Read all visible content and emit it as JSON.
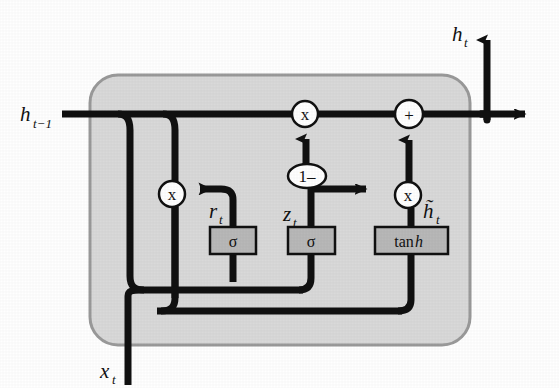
{
  "figure": {
    "background_color": "#ffffff",
    "line_color": "#111111",
    "cell_fill_color": "#d9d9d9",
    "cell_border_color": "#9a9a9a",
    "gate_fill_color": "#b8b8b8",
    "gate_border_color": "#111111"
  },
  "labels": {
    "prev_hidden_state": "h",
    "prev_hidden_state_sub": "t−1",
    "output_hidden_state": "h",
    "output_hidden_state_sub": "t",
    "input": "x",
    "input_sub": "t",
    "reset_gate": "r",
    "reset_gate_sub": "t",
    "update_gate": "z",
    "update_gate_sub": "t",
    "candidate_state": "h̃",
    "candidate_state_sub": "t"
  },
  "gates": [
    {
      "id": "reset-gate",
      "text": "σ",
      "italic_tail": "",
      "x": 210,
      "y": 227,
      "w": 46,
      "h": 27
    },
    {
      "id": "update-gate",
      "text": "σ",
      "italic_tail": "",
      "x": 288,
      "y": 227,
      "w": 47,
      "h": 27
    },
    {
      "id": "candidate-gate",
      "text": "tan",
      "italic_tail": "h",
      "x": 375,
      "y": 227,
      "w": 73,
      "h": 27
    }
  ],
  "operators": [
    {
      "id": "reset-multiply",
      "symbol": "x",
      "cx": 172,
      "cy": 194,
      "r": 13
    },
    {
      "id": "forget-multiply",
      "symbol": "x",
      "cx": 305,
      "cy": 114,
      "r": 13
    },
    {
      "id": "candidate-multiply",
      "symbol": "x",
      "cx": 408,
      "cy": 195,
      "r": 13
    },
    {
      "id": "sum-add",
      "symbol": "+",
      "cx": 409,
      "cy": 114,
      "r": 14
    },
    {
      "id": "one-minus",
      "symbol": "1–",
      "cx": 307,
      "cy": 176,
      "rx": 19,
      "ry": 12
    }
  ],
  "cell_box": {
    "x": 90,
    "y": 75,
    "w": 380,
    "h": 270,
    "radius": 28
  },
  "legend_note": ""
}
